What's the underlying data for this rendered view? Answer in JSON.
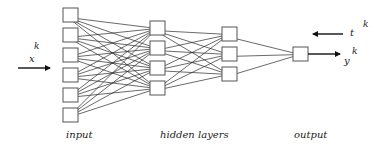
{
  "diagram": {
    "type": "feedforward-neural-network",
    "colors": {
      "background": "#ffffff",
      "node_stroke": "#555555",
      "edge": "#2a2a2a",
      "text": "#222222"
    },
    "node_size": 15,
    "layers": [
      {
        "name": "input",
        "x": 63,
        "ys": [
          8,
          28,
          48,
          68,
          88,
          108
        ]
      },
      {
        "name": "hidden-1",
        "x": 150,
        "ys": [
          21,
          41,
          61,
          81
        ]
      },
      {
        "name": "hidden-2",
        "x": 222,
        "ys": [
          27,
          47,
          67
        ]
      },
      {
        "name": "output",
        "x": 293,
        "ys": [
          47
        ]
      }
    ],
    "connectivity": "fully-connected-between-adjacent-layers"
  },
  "labels": {
    "input": "input",
    "hidden": "hidden layers",
    "output": "output"
  },
  "variables": {
    "input_var": "x",
    "input_sup": "k",
    "target_var": "t",
    "target_sup": "k",
    "output_var": "y",
    "output_sup": "k"
  }
}
